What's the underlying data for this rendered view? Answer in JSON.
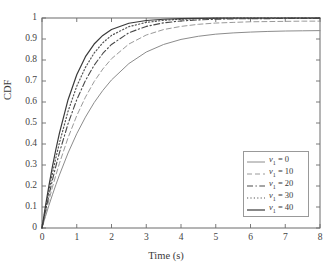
{
  "chart_data": {
    "type": "line",
    "title": "",
    "xlabel": "Time (s)",
    "ylabel": "CDF",
    "xlim": [
      0,
      8
    ],
    "ylim": [
      0,
      1
    ],
    "grid": false,
    "legend_position": "lower right",
    "xticks": [
      "0",
      "1",
      "2",
      "3",
      "4",
      "5",
      "6",
      "7",
      "8"
    ],
    "xtick_values": [
      0,
      1,
      2,
      3,
      4,
      5,
      6,
      7,
      8
    ],
    "yticks": [
      "0",
      "0.1",
      "0.2",
      "0.3",
      "0.4",
      "0.5",
      "0.6",
      "0.7",
      "0.8",
      "0.9",
      "1"
    ],
    "ytick_values": [
      0,
      0.1,
      0.2,
      0.3,
      0.4,
      0.5,
      0.6,
      0.7,
      0.8,
      0.9,
      1
    ],
    "x": [
      0,
      0.1,
      0.2,
      0.3,
      0.4,
      0.5,
      0.75,
      1,
      1.25,
      1.5,
      1.75,
      2,
      2.5,
      3,
      3.5,
      4,
      4.5,
      5,
      5.5,
      6,
      6.5,
      7,
      7.5,
      8
    ],
    "series": [
      {
        "name": "v_1 = 0",
        "label_symbol": "ν",
        "label_subscript": "1",
        "label_value": "0",
        "style": "solid",
        "color": "#8c8c8c",
        "width": 1.0,
        "values": [
          0,
          0.055,
          0.108,
          0.158,
          0.206,
          0.252,
          0.357,
          0.449,
          0.528,
          0.597,
          0.655,
          0.705,
          0.783,
          0.838,
          0.874,
          0.898,
          0.913,
          0.923,
          0.929,
          0.933,
          0.936,
          0.938,
          0.939,
          0.94
        ]
      },
      {
        "name": "v_1 = 10",
        "label_symbol": "ν",
        "label_subscript": "1",
        "label_value": "10",
        "style": "dashed",
        "color": "#9a9a9a",
        "width": 1.0,
        "values": [
          0,
          0.068,
          0.133,
          0.194,
          0.252,
          0.307,
          0.43,
          0.535,
          0.623,
          0.697,
          0.757,
          0.806,
          0.876,
          0.919,
          0.945,
          0.96,
          0.97,
          0.976,
          0.979,
          0.982,
          0.983,
          0.984,
          0.985,
          0.985
        ]
      },
      {
        "name": "v_1 = 20",
        "label_symbol": "ν",
        "label_subscript": "1",
        "label_value": "20",
        "style": "dashdot",
        "color": "#4a4a4a",
        "width": 1.1,
        "values": [
          0,
          0.08,
          0.156,
          0.228,
          0.295,
          0.358,
          0.497,
          0.611,
          0.702,
          0.775,
          0.831,
          0.874,
          0.93,
          0.96,
          0.977,
          0.986,
          0.991,
          0.994,
          0.996,
          0.997,
          0.997,
          0.998,
          0.998,
          0.998
        ]
      },
      {
        "name": "v_1 = 30",
        "label_symbol": "ν",
        "label_subscript": "1",
        "label_value": "30",
        "style": "dotted",
        "color": "#555555",
        "width": 1.2,
        "values": [
          0,
          0.092,
          0.178,
          0.259,
          0.335,
          0.404,
          0.556,
          0.675,
          0.765,
          0.833,
          0.882,
          0.917,
          0.959,
          0.979,
          0.989,
          0.994,
          0.997,
          0.998,
          0.999,
          0.999,
          1.0,
          1.0,
          1.0,
          1.0
        ]
      },
      {
        "name": "v_1 = 40",
        "label_symbol": "ν",
        "label_subscript": "1",
        "label_value": "40",
        "style": "solid",
        "color": "#3a3a3a",
        "width": 1.2,
        "values": [
          0,
          0.105,
          0.202,
          0.292,
          0.375,
          0.451,
          0.611,
          0.73,
          0.816,
          0.876,
          0.917,
          0.945,
          0.975,
          0.988,
          0.994,
          0.997,
          0.998,
          0.999,
          1.0,
          1.0,
          1.0,
          1.0,
          1.0,
          1.0
        ]
      }
    ]
  },
  "axes": {
    "y_title": "CDF",
    "x_title": "Time (s)"
  },
  "legend": {
    "entries": [
      {
        "text_value": "0"
      },
      {
        "text_value": "10"
      },
      {
        "text_value": "20"
      },
      {
        "text_value": "30"
      },
      {
        "text_value": "40"
      }
    ]
  },
  "colors": {
    "axis": "#6b6b6b",
    "background": "#ffffff",
    "legend_border": "#999999"
  }
}
